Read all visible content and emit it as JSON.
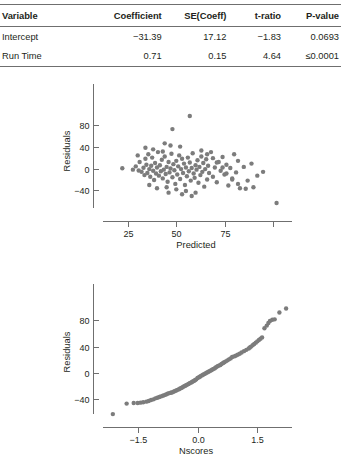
{
  "table": {
    "headers": [
      "Variable",
      "Coefficient",
      "SE(Coeff)",
      "t-ratio",
      "P-value"
    ],
    "rows": [
      {
        "variable": "Intercept",
        "coefficient": "−31.39",
        "se_coeff": "17.12",
        "t_ratio": "−1.83",
        "p_value": "0.0693"
      },
      {
        "variable": "Run Time",
        "coefficient": "0.71",
        "se_coeff": "0.15",
        "t_ratio": "4.64",
        "p_value": "≤0.0001"
      }
    ]
  },
  "chart_data": [
    {
      "type": "scatter",
      "name": "residuals-vs-predicted",
      "title": "",
      "xlabel": "Predicted",
      "ylabel": "Residuals",
      "xlim": [
        12,
        110
      ],
      "ylim": [
        -72,
        105
      ],
      "xticks": [
        25,
        50,
        75,
        100
      ],
      "xtick_labels": [
        "25",
        "50",
        "75",
        ""
      ],
      "yticks": [
        80,
        40,
        0,
        -40
      ],
      "ytick_labels": [
        "80",
        "40",
        "0",
        "−40"
      ],
      "grid": false,
      "legend": "none",
      "point_color": "#7c7c7c",
      "points": [
        [
          22.0,
          0.5
        ],
        [
          27.5,
          -2.0
        ],
        [
          29.0,
          4.0
        ],
        [
          30.5,
          -3.5
        ],
        [
          31.0,
          12.0
        ],
        [
          32.0,
          -6.0
        ],
        [
          33.0,
          1.5
        ],
        [
          33.5,
          -12.0
        ],
        [
          34.0,
          18.0
        ],
        [
          34.5,
          7.0
        ],
        [
          35.0,
          -8.0
        ],
        [
          35.5,
          26.0
        ],
        [
          36.0,
          -1.0
        ],
        [
          36.5,
          -15.0
        ],
        [
          37.0,
          5.0
        ],
        [
          37.5,
          20.0
        ],
        [
          38.0,
          -4.0
        ],
        [
          38.5,
          -21.0
        ],
        [
          39.0,
          10.0
        ],
        [
          39.5,
          -9.0
        ],
        [
          40.0,
          2.0
        ],
        [
          40.5,
          30.0
        ],
        [
          41.0,
          -13.0
        ],
        [
          41.5,
          6.0
        ],
        [
          42.0,
          -5.0
        ],
        [
          42.5,
          16.0
        ],
        [
          43.0,
          -18.0
        ],
        [
          43.5,
          -2.0
        ],
        [
          44.0,
          22.0
        ],
        [
          44.5,
          -10.0
        ],
        [
          45.0,
          3.0
        ],
        [
          45.5,
          -24.0
        ],
        [
          46.0,
          12.0
        ],
        [
          46.5,
          -7.0
        ],
        [
          47.0,
          0.0
        ],
        [
          47.5,
          27.0
        ],
        [
          48.0,
          -16.0
        ],
        [
          48.5,
          8.0
        ],
        [
          49.0,
          -3.0
        ],
        [
          49.5,
          -28.0
        ],
        [
          50.0,
          14.0
        ],
        [
          50.5,
          -11.0
        ],
        [
          51.0,
          4.0
        ],
        [
          51.5,
          24.0
        ],
        [
          52.0,
          -19.0
        ],
        [
          52.5,
          -1.0
        ],
        [
          53.0,
          18.0
        ],
        [
          53.5,
          -8.0
        ],
        [
          54.0,
          9.0
        ],
        [
          54.5,
          -30.0
        ],
        [
          55.0,
          2.0
        ],
        [
          55.5,
          -14.0
        ],
        [
          56.0,
          20.0
        ],
        [
          56.5,
          -5.0
        ],
        [
          57.0,
          11.0
        ],
        [
          57.5,
          -22.0
        ],
        [
          58.0,
          1.0
        ],
        [
          58.5,
          28.0
        ],
        [
          59.0,
          -9.0
        ],
        [
          59.5,
          -17.0
        ],
        [
          60.0,
          6.0
        ],
        [
          60.5,
          -2.0
        ],
        [
          61.0,
          15.0
        ],
        [
          61.5,
          -26.0
        ],
        [
          62.0,
          3.0
        ],
        [
          62.5,
          -12.0
        ],
        [
          63.0,
          22.0
        ],
        [
          63.5,
          -6.0
        ],
        [
          64.0,
          10.0
        ],
        [
          64.5,
          -33.0
        ],
        [
          65.0,
          -1.0
        ],
        [
          65.5,
          17.0
        ],
        [
          66.0,
          -20.0
        ],
        [
          66.5,
          5.0
        ],
        [
          67.0,
          -8.0
        ],
        [
          68.0,
          30.0
        ],
        [
          69.0,
          -15.0
        ],
        [
          70.0,
          2.0
        ],
        [
          71.0,
          -25.0
        ],
        [
          72.0,
          12.0
        ],
        [
          73.0,
          -4.0
        ],
        [
          74.0,
          21.0
        ],
        [
          75.0,
          -11.0
        ],
        [
          76.0,
          7.0
        ],
        [
          77.0,
          -31.0
        ],
        [
          78.0,
          1.0
        ],
        [
          79.0,
          -18.0
        ],
        [
          80.0,
          26.0
        ],
        [
          81.0,
          -7.0
        ],
        [
          82.0,
          14.0
        ],
        [
          83.0,
          -36.0
        ],
        [
          85.0,
          3.0
        ],
        [
          87.0,
          -22.0
        ],
        [
          89.0,
          9.0
        ],
        [
          92.0,
          -13.0
        ],
        [
          48.0,
          72.0
        ],
        [
          57.0,
          96.0
        ],
        [
          44.0,
          46.0
        ],
        [
          47.0,
          42.0
        ],
        [
          52.0,
          40.0
        ],
        [
          63.0,
          33.0
        ],
        [
          66.0,
          26.0
        ],
        [
          69.0,
          19.0
        ],
        [
          71.0,
          11.0
        ],
        [
          74.0,
          2.0
        ],
        [
          76.0,
          -9.0
        ],
        [
          79.0,
          -20.0
        ],
        [
          82.0,
          -28.0
        ],
        [
          86.0,
          -37.0
        ],
        [
          90.0,
          -34.0
        ],
        [
          95.0,
          -6.0
        ],
        [
          102.0,
          -63.0
        ],
        [
          34.0,
          38.0
        ],
        [
          38.0,
          35.0
        ],
        [
          43.0,
          31.0
        ],
        [
          30.0,
          24.0
        ],
        [
          45.0,
          -34.0
        ],
        [
          50.0,
          -38.0
        ],
        [
          55.0,
          -41.0
        ],
        [
          60.0,
          -44.0
        ],
        [
          36.0,
          -30.0
        ],
        [
          40.0,
          -36.0
        ],
        [
          53.0,
          -47.0
        ],
        [
          58.0,
          -50.0
        ],
        [
          46.0,
          -44.0
        ]
      ]
    },
    {
      "type": "scatter",
      "name": "normal-probability-plot",
      "title": "",
      "xlabel": "Nscores",
      "ylabel": "Residuals",
      "xlim": [
        -2.4,
        2.4
      ],
      "ylim": [
        -72,
        108
      ],
      "xticks": [
        -1.5,
        0.0,
        1.5
      ],
      "xtick_labels": [
        "−1.5",
        "0.0",
        "1.5"
      ],
      "yticks": [
        80,
        40,
        0,
        -40
      ],
      "ytick_labels": [
        "80",
        "40",
        "0",
        "−40"
      ],
      "grid": false,
      "legend": "none",
      "point_color": "#7c7c7c",
      "points": [
        [
          -2.15,
          -63.0
        ],
        [
          -1.8,
          -47.0
        ],
        [
          -1.62,
          -46.0
        ],
        [
          -1.52,
          -46.0
        ],
        [
          -1.45,
          -45.5
        ],
        [
          -1.38,
          -45.0
        ],
        [
          -1.3,
          -44.0
        ],
        [
          -1.24,
          -43.0
        ],
        [
          -1.18,
          -41.5
        ],
        [
          -1.12,
          -40.5
        ],
        [
          -1.07,
          -39.0
        ],
        [
          -1.02,
          -38.0
        ],
        [
          -0.97,
          -37.0
        ],
        [
          -0.93,
          -36.0
        ],
        [
          -0.88,
          -35.0
        ],
        [
          -0.84,
          -34.0
        ],
        [
          -0.8,
          -33.0
        ],
        [
          -0.76,
          -32.0
        ],
        [
          -0.72,
          -31.0
        ],
        [
          -0.68,
          -30.5
        ],
        [
          -0.65,
          -30.0
        ],
        [
          -0.61,
          -29.0
        ],
        [
          -0.58,
          -28.0
        ],
        [
          -0.54,
          -27.0
        ],
        [
          -0.51,
          -26.0
        ],
        [
          -0.47,
          -25.0
        ],
        [
          -0.44,
          -24.0
        ],
        [
          -0.41,
          -23.0
        ],
        [
          -0.38,
          -22.0
        ],
        [
          -0.35,
          -21.0
        ],
        [
          -0.32,
          -20.0
        ],
        [
          -0.29,
          -19.0
        ],
        [
          -0.26,
          -18.0
        ],
        [
          -0.23,
          -17.0
        ],
        [
          -0.2,
          -16.0
        ],
        [
          -0.17,
          -15.0
        ],
        [
          -0.14,
          -14.0
        ],
        [
          -0.11,
          -13.0
        ],
        [
          -0.08,
          -12.0
        ],
        [
          -0.06,
          -11.0
        ],
        [
          -0.03,
          -10.0
        ],
        [
          0.0,
          -8.0
        ],
        [
          0.03,
          -7.0
        ],
        [
          0.06,
          -6.0
        ],
        [
          0.08,
          -5.0
        ],
        [
          0.11,
          -4.0
        ],
        [
          0.14,
          -3.0
        ],
        [
          0.17,
          -2.0
        ],
        [
          0.2,
          -1.0
        ],
        [
          0.23,
          0.0
        ],
        [
          0.26,
          1.0
        ],
        [
          0.29,
          2.0
        ],
        [
          0.32,
          3.0
        ],
        [
          0.35,
          4.0
        ],
        [
          0.38,
          5.0
        ],
        [
          0.41,
          6.0
        ],
        [
          0.44,
          7.0
        ],
        [
          0.47,
          8.5
        ],
        [
          0.51,
          10.0
        ],
        [
          0.54,
          11.0
        ],
        [
          0.58,
          12.0
        ],
        [
          0.61,
          13.5
        ],
        [
          0.65,
          15.0
        ],
        [
          0.68,
          16.0
        ],
        [
          0.72,
          17.5
        ],
        [
          0.76,
          19.0
        ],
        [
          0.8,
          20.5
        ],
        [
          0.84,
          22.0
        ],
        [
          0.88,
          24.0
        ],
        [
          0.93,
          25.0
        ],
        [
          0.97,
          26.0
        ],
        [
          1.02,
          27.5
        ],
        [
          1.07,
          29.0
        ],
        [
          1.12,
          31.0
        ],
        [
          1.18,
          33.0
        ],
        [
          1.24,
          35.0
        ],
        [
          1.3,
          37.0
        ],
        [
          1.33,
          38.5
        ],
        [
          1.36,
          40.0
        ],
        [
          1.4,
          42.0
        ],
        [
          1.44,
          44.0
        ],
        [
          1.48,
          46.0
        ],
        [
          1.52,
          48.0
        ],
        [
          1.56,
          50.0
        ],
        [
          1.6,
          52.0
        ],
        [
          1.64,
          54.0
        ],
        [
          1.7,
          68.0
        ],
        [
          1.76,
          72.0
        ],
        [
          1.8,
          76.0
        ],
        [
          1.84,
          79.0
        ],
        [
          1.9,
          81.0
        ],
        [
          1.96,
          81.5
        ],
        [
          2.08,
          92.0
        ],
        [
          2.25,
          98.0
        ]
      ]
    }
  ]
}
